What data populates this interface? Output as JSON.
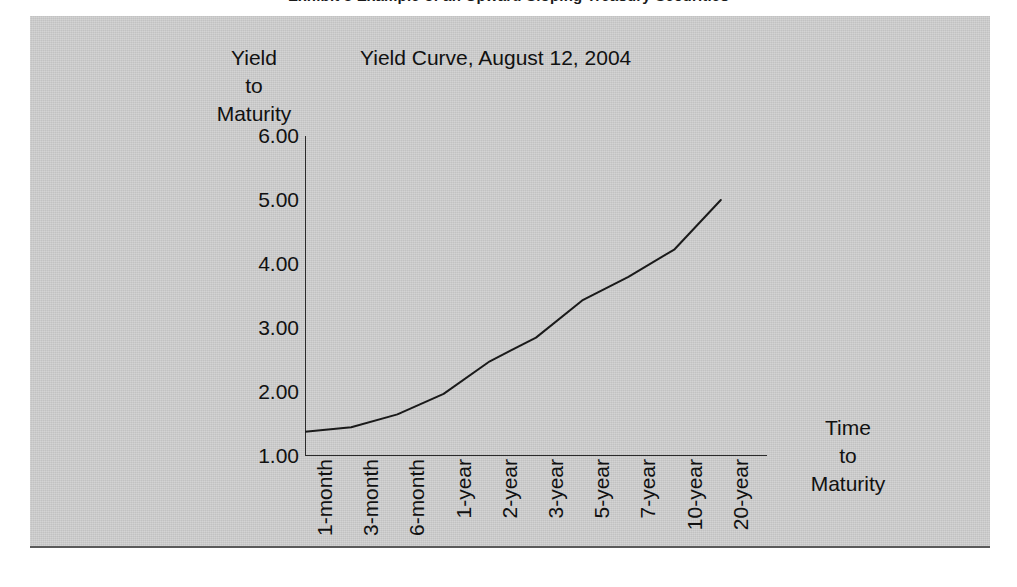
{
  "page": {
    "heading": "Exhibit 3  Example of an Upward Sloping Treasury Securities"
  },
  "figure": {
    "background_color": "#cfcfcf",
    "border_color": "#5a5a5a"
  },
  "chart_data": {
    "type": "line",
    "title": "Yield Curve, August 12, 2004",
    "xlabel": "Time to Maturity",
    "ylabel": "Yield to Maturity",
    "xlabel_lines": [
      "Time",
      "to",
      "Maturity"
    ],
    "ylabel_lines": [
      "Yield",
      "to",
      "Maturity"
    ],
    "categories": [
      "1-month",
      "3-month",
      "6-month",
      "1-year",
      "2-year",
      "3-year",
      "5-year",
      "7-year",
      "10-year",
      "20-year"
    ],
    "values": [
      1.38,
      1.45,
      1.65,
      1.97,
      2.48,
      2.85,
      3.43,
      3.8,
      4.23,
      5.0
    ],
    "series": [
      {
        "name": "Yield Curve, August 12, 2004",
        "values": [
          1.38,
          1.45,
          1.65,
          1.97,
          2.48,
          2.85,
          3.43,
          3.8,
          4.23,
          5.0
        ]
      }
    ],
    "ylim": [
      1.0,
      6.0
    ],
    "yticks": [
      1.0,
      2.0,
      3.0,
      4.0,
      5.0,
      6.0
    ],
    "ytick_labels": [
      "1.00",
      "2.00",
      "3.00",
      "4.00",
      "5.00",
      "6.00"
    ],
    "grid": false,
    "legend": false,
    "line_color": "#1a1a1a",
    "axis_color": "#2b2b2b"
  }
}
